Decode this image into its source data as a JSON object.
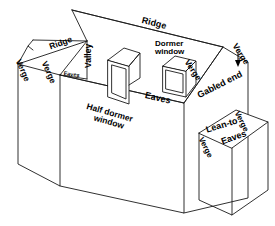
{
  "diagram": {
    "background_color": "#ffffff",
    "line_color": "#1a1a1a",
    "labels": {
      "ridge_main": "Ridge",
      "ridge_wing": "Ridge",
      "verge_wing_left": "Verge",
      "verge_wing_right": "Verge",
      "eaves_wing": "Eaves",
      "valley": "Valley",
      "half_dormer_window": "Half dormer\nwindow",
      "half_dormer_window_line1": "Half dormer",
      "half_dormer_window_line2": "window",
      "dormer_window_line1": "Dormer",
      "dormer_window_line2": "window",
      "eaves_main": "Eaves",
      "verge_gable_left": "Verge",
      "verge_gable_right": "Verge",
      "gabled_end": "Gabled end",
      "lean_to": "Lean-to",
      "verge_leanto_right": "Verge",
      "verge_leanto_left": "Verge",
      "eaves_leanto": "Eaves"
    }
  }
}
